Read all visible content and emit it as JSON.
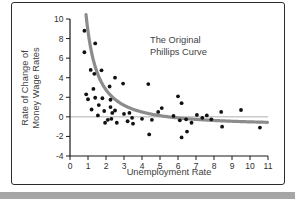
{
  "card": {
    "border_color": "#2b2b2b",
    "background": "#ffffff"
  },
  "page": {
    "background": "#ffffff",
    "bottom_strip_color": "#a6a6a6"
  },
  "chart_data": {
    "type": "scatter",
    "title_line1": "The Original",
    "title_line2": "Phillips Curve",
    "xlabel": "Unemployment Rate",
    "ylabel_line1": "Rate of Change of",
    "ylabel_line2": "Money Wage Rates",
    "xlim": [
      0,
      11
    ],
    "ylim": [
      -4,
      10
    ],
    "x_ticks": [
      0,
      1,
      2,
      3,
      4,
      5,
      6,
      7,
      8,
      9,
      10,
      11
    ],
    "y_ticks": [
      10,
      8,
      6,
      4,
      2,
      0,
      -2,
      -4
    ],
    "zero_line": true,
    "grid": false,
    "point_color": "#111111",
    "axis_color": "#1a1a1a",
    "zero_line_color": "#999999",
    "points": [
      [
        0.8,
        8.8
      ],
      [
        1.4,
        7.5
      ],
      [
        0.8,
        6.6
      ],
      [
        1.15,
        4.8
      ],
      [
        1.35,
        4.4
      ],
      [
        1.75,
        4.75
      ],
      [
        2.5,
        4.0
      ],
      [
        2.95,
        3.4
      ],
      [
        2.2,
        3.1
      ],
      [
        1.3,
        2.85
      ],
      [
        0.9,
        2.3
      ],
      [
        1.0,
        1.8
      ],
      [
        1.4,
        1.95
      ],
      [
        1.8,
        1.9
      ],
      [
        2.25,
        1.75
      ],
      [
        1.6,
        1.2
      ],
      [
        2.25,
        1.0
      ],
      [
        1.2,
        0.75
      ],
      [
        1.9,
        0.6
      ],
      [
        2.35,
        0.4
      ],
      [
        1.55,
        0.15
      ],
      [
        2.5,
        0.65
      ],
      [
        2.1,
        -0.3
      ],
      [
        1.95,
        -0.6
      ],
      [
        2.6,
        -0.6
      ],
      [
        2.3,
        -0.2
      ],
      [
        3.0,
        0.3
      ],
      [
        3.3,
        0.4
      ],
      [
        3.45,
        -0.1
      ],
      [
        3.2,
        -0.45
      ],
      [
        3.5,
        -0.7
      ],
      [
        4.0,
        -0.2
      ],
      [
        4.35,
        3.35
      ],
      [
        4.4,
        -1.8
      ],
      [
        4.55,
        -0.3
      ],
      [
        4.9,
        0.5
      ],
      [
        5.1,
        0.9
      ],
      [
        5.75,
        0.1
      ],
      [
        6.0,
        2.1
      ],
      [
        6.2,
        1.4
      ],
      [
        6.1,
        -0.35
      ],
      [
        6.45,
        -0.25
      ],
      [
        6.2,
        -2.1
      ],
      [
        6.5,
        -1.5
      ],
      [
        6.75,
        -0.6
      ],
      [
        7.05,
        0.2
      ],
      [
        7.35,
        -0.1
      ],
      [
        7.6,
        0.15
      ],
      [
        7.85,
        -0.25
      ],
      [
        8.4,
        0.5
      ],
      [
        8.45,
        -1.0
      ],
      [
        9.5,
        0.7
      ],
      [
        10.55,
        -1.1
      ]
    ],
    "curve": {
      "name": "fitted-phillips-curve",
      "a": -0.9,
      "b": 9.64,
      "c": -1.394,
      "x_start": 0.89,
      "x_end": 11,
      "color": "#8c8c8c",
      "width": 3.2
    }
  }
}
